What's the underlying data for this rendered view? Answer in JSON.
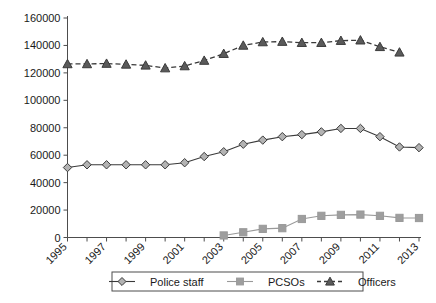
{
  "chart_data": {
    "type": "line",
    "title": "",
    "subtitle": "",
    "xlabel": "",
    "ylabel": "",
    "x": [
      1995,
      1996,
      1997,
      1998,
      1999,
      2000,
      2001,
      2002,
      2003,
      2004,
      2005,
      2006,
      2007,
      2008,
      2009,
      2010,
      2011,
      2012,
      2013
    ],
    "xtick_labels": [
      "1995",
      "1997",
      "1999",
      "2001",
      "2003",
      "2005",
      "2007",
      "2009",
      "2011",
      "2013"
    ],
    "xtick_values": [
      1995,
      1997,
      1999,
      2001,
      2003,
      2005,
      2007,
      2009,
      2011,
      2013
    ],
    "ytick_labels": [
      "0",
      "20000",
      "40000",
      "60000",
      "80000",
      "100000",
      "120000",
      "140000",
      "160000"
    ],
    "ytick_values": [
      0,
      20000,
      40000,
      60000,
      80000,
      100000,
      120000,
      140000,
      160000
    ],
    "ylim": [
      0,
      160000
    ],
    "xlim": [
      1995,
      2013
    ],
    "grid": false,
    "legend_position": "bottom",
    "series": [
      {
        "name": "Police staff",
        "marker": "diamond",
        "linestyle": "solid",
        "color": "#3a3a3a",
        "marker_fill": "#b3b3b3",
        "x": [
          1995,
          1996,
          1997,
          1998,
          1999,
          2000,
          2001,
          2002,
          2003,
          2004,
          2005,
          2006,
          2007,
          2008,
          2009,
          2010,
          2011,
          2012,
          2013
        ],
        "values": [
          51000,
          53000,
          53000,
          53000,
          53000,
          53000,
          54500,
          59000,
          62500,
          68000,
          71000,
          73500,
          75000,
          77000,
          79500,
          79500,
          73500,
          66000,
          65500
        ]
      },
      {
        "name": "PCSOs",
        "marker": "square",
        "linestyle": "solid",
        "color": "#999999",
        "marker_fill": "#9e9e9e",
        "x": [
          2003,
          2004,
          2005,
          2006,
          2007,
          2008,
          2009,
          2010,
          2011,
          2012,
          2013
        ],
        "values": [
          1500,
          3800,
          6300,
          6800,
          13500,
          15800,
          16500,
          16700,
          15800,
          14300,
          14200
        ]
      },
      {
        "name": "Officers",
        "marker": "triangle",
        "linestyle": "dashed",
        "color": "#3a3a3a",
        "marker_fill": "#5a5a5a",
        "x": [
          1995,
          1996,
          1997,
          1998,
          1999,
          2000,
          2001,
          2002,
          2003,
          2004,
          2005,
          2006,
          2007,
          2008,
          2009,
          2010,
          2011,
          2012
        ],
        "values": [
          126500,
          126500,
          126800,
          126200,
          125500,
          123500,
          125000,
          129000,
          134000,
          140000,
          142500,
          142800,
          142000,
          142000,
          143500,
          143800,
          139000,
          135000
        ]
      }
    ]
  },
  "legend": {
    "items": [
      {
        "label": "Police staff",
        "marker": "diamond",
        "linestyle": "solid"
      },
      {
        "label": "PCSOs",
        "marker": "square",
        "linestyle": "solid"
      },
      {
        "label": "Officers",
        "marker": "triangle",
        "linestyle": "dashed"
      }
    ]
  }
}
